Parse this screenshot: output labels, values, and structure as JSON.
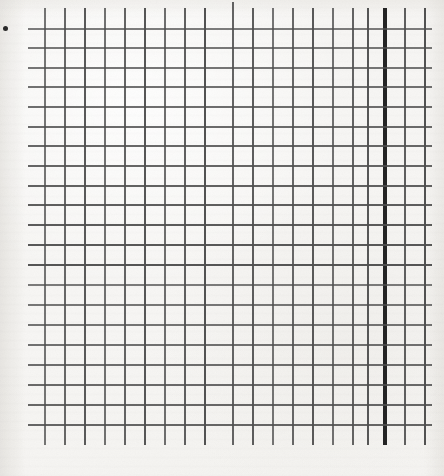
{
  "document": {
    "kind": "scanned-graph-paper",
    "title": "Graph paper grid",
    "width": 444,
    "height": 476,
    "background_color": "#f7f6f4",
    "line_color": "#4f4f4f",
    "heavy_line_color": "#242424",
    "ink_color": "#2b2b2b"
  },
  "grid": {
    "cell_size": 19.8,
    "vertical_line_count": 20,
    "horizontal_line_count": 21,
    "first_vertical_x": 45,
    "last_vertical_x": 425,
    "first_horizontal_y": 29,
    "last_horizontal_y": 425,
    "vertical_top_overshoot_y": 8,
    "vertical_bottom_overshoot_y": 445,
    "horizontal_left_overshoot_x": 28,
    "horizontal_right_overshoot_x": 432,
    "line_thickness": 1.6,
    "heavy_line_thickness": 3.1,
    "heavy_vertical_index": 17,
    "heavy_vertical_x": 385,
    "tall_tick_vertical_index": 9,
    "tall_tick_vertical_x": 233,
    "tall_tick_top_y": 2,
    "vertical_x_positions": [
      45,
      65,
      85,
      105,
      125,
      145,
      165,
      185,
      205,
      233,
      253,
      273,
      293,
      313,
      333,
      353,
      368,
      385,
      405,
      425
    ],
    "horizontal_y_positions": [
      29,
      48,
      68,
      87,
      107,
      127,
      146,
      166,
      186,
      205,
      225,
      245,
      265,
      285,
      305,
      325,
      345,
      365,
      385,
      405,
      425
    ]
  },
  "marks": [
    {
      "name": "stray-ink-dot",
      "x": 3,
      "y": 26,
      "width": 5,
      "height": 5,
      "color": "#2b2b2b"
    }
  ]
}
